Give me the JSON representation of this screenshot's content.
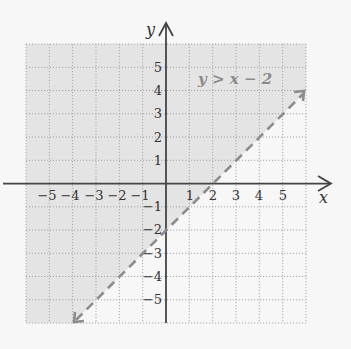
{
  "diagram": {
    "type": "inequality-graph",
    "inequality_label": "y > x − 2",
    "boundary": {
      "equation": "y = x - 2",
      "slope": 1,
      "intercept": -2,
      "style": "dashed",
      "color": "#8c8c8c"
    },
    "shaded_region": "above boundary",
    "axes": {
      "x_label": "x",
      "y_label": "y",
      "x_ticks": [
        "−5",
        "−4",
        "−3",
        "−2",
        "−1",
        "1",
        "2",
        "3",
        "4",
        "5"
      ],
      "y_ticks_positive": [
        "5",
        "4",
        "3",
        "2",
        "1"
      ],
      "y_ticks_negative": [
        "−1",
        "−2",
        "−3",
        "−4",
        "−5"
      ],
      "range": [
        -6,
        6
      ]
    },
    "colors": {
      "shade": "#e4e4e4",
      "unshaded": "#f7f7f7",
      "grid": "#a8a8a8",
      "axis": "#444444"
    }
  }
}
